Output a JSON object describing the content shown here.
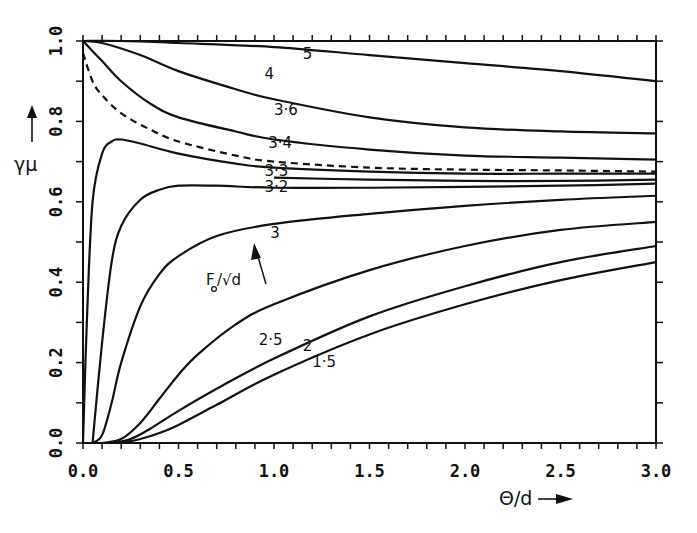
{
  "chart_data": {
    "type": "line",
    "title": "",
    "xlabel": "Θ/d",
    "ylabel": "γμ",
    "xlim": [
      0.0,
      3.0
    ],
    "ylim": [
      0.0,
      1.0
    ],
    "grid": false,
    "legend": null,
    "parameter_label": "F₀/√d",
    "xticks": [
      "0.0",
      "0.5",
      "1.0",
      "1.5",
      "2.0",
      "2.5",
      "3.0"
    ],
    "yticks": [
      "0.0",
      "0.2",
      "0.4",
      "0.6",
      "0.8",
      "1.0"
    ],
    "series": [
      {
        "name": "5",
        "style": "solid",
        "label_at": [
          1.15,
          0.955
        ],
        "x": [
          0.0,
          0.2,
          0.5,
          1.0,
          1.5,
          2.0,
          2.5,
          3.0
        ],
        "y": [
          1.0,
          1.0,
          0.995,
          0.985,
          0.965,
          0.945,
          0.925,
          0.9
        ]
      },
      {
        "name": "4",
        "style": "solid",
        "label_at": [
          0.95,
          0.905
        ],
        "x": [
          0.0,
          0.1,
          0.3,
          0.5,
          0.8,
          1.0,
          1.5,
          2.0,
          2.5,
          3.0
        ],
        "y": [
          1.0,
          0.995,
          0.965,
          0.925,
          0.88,
          0.855,
          0.81,
          0.785,
          0.775,
          0.77
        ]
      },
      {
        "name": "3.6",
        "style": "solid",
        "label_at": [
          1.0,
          0.815
        ],
        "x": [
          0.0,
          0.1,
          0.2,
          0.35,
          0.5,
          0.8,
          1.0,
          1.5,
          2.0,
          2.5,
          3.0
        ],
        "y": [
          1.0,
          0.95,
          0.9,
          0.845,
          0.81,
          0.775,
          0.755,
          0.73,
          0.715,
          0.71,
          0.705
        ]
      },
      {
        "name": "dashed",
        "style": "dashed",
        "label_at": null,
        "x": [
          0.0,
          0.05,
          0.1,
          0.2,
          0.35,
          0.5,
          0.8,
          1.0,
          1.5,
          2.0,
          2.5,
          3.0
        ],
        "y": [
          0.97,
          0.9,
          0.865,
          0.82,
          0.78,
          0.75,
          0.715,
          0.7,
          0.685,
          0.68,
          0.678,
          0.675
        ]
      },
      {
        "name": "3.4",
        "style": "solid",
        "label_at": [
          0.97,
          0.735
        ],
        "x": [
          0.0,
          0.02,
          0.05,
          0.1,
          0.15,
          0.2,
          0.3,
          0.5,
          0.8,
          1.0,
          1.5,
          2.0,
          2.5,
          3.0
        ],
        "y": [
          0.0,
          0.3,
          0.6,
          0.72,
          0.75,
          0.755,
          0.745,
          0.72,
          0.695,
          0.685,
          0.675,
          0.67,
          0.67,
          0.67
        ]
      },
      {
        "name": "3.3",
        "style": "solid",
        "label_at": [
          0.95,
          0.665
        ],
        "x": [
          1.0,
          1.5,
          2.0,
          2.5,
          3.0
        ],
        "y": [
          0.66,
          0.655,
          0.652,
          0.652,
          0.655
        ]
      },
      {
        "name": "3.2",
        "style": "solid",
        "label_at": [
          0.95,
          0.625
        ],
        "x": [
          0.05,
          0.1,
          0.15,
          0.2,
          0.3,
          0.4,
          0.5,
          0.7,
          1.0,
          1.5,
          2.0,
          2.5,
          3.0
        ],
        "y": [
          0.0,
          0.25,
          0.45,
          0.54,
          0.605,
          0.63,
          0.64,
          0.64,
          0.635,
          0.635,
          0.637,
          0.64,
          0.645
        ]
      },
      {
        "name": "3",
        "style": "solid",
        "label_at": [
          0.98,
          0.51
        ],
        "x": [
          0.05,
          0.1,
          0.15,
          0.2,
          0.3,
          0.4,
          0.5,
          0.7,
          1.0,
          1.5,
          2.0,
          2.5,
          3.0
        ],
        "y": [
          0.0,
          0.02,
          0.1,
          0.2,
          0.34,
          0.42,
          0.465,
          0.515,
          0.545,
          0.57,
          0.59,
          0.605,
          0.615
        ]
      },
      {
        "name": "2.5",
        "style": "solid",
        "label_at": [
          0.92,
          0.245
        ],
        "x": [
          0.1,
          0.2,
          0.3,
          0.4,
          0.5,
          0.6,
          0.8,
          1.0,
          1.5,
          2.0,
          2.5,
          3.0
        ],
        "y": [
          0.0,
          0.01,
          0.05,
          0.11,
          0.17,
          0.22,
          0.295,
          0.345,
          0.43,
          0.49,
          0.53,
          0.55
        ]
      },
      {
        "name": "2",
        "style": "solid",
        "label_at": [
          1.15,
          0.23
        ],
        "x": [
          0.15,
          0.25,
          0.35,
          0.5,
          0.7,
          1.0,
          1.5,
          2.0,
          2.5,
          3.0
        ],
        "y": [
          0.0,
          0.01,
          0.035,
          0.08,
          0.135,
          0.21,
          0.315,
          0.39,
          0.45,
          0.49
        ]
      },
      {
        "name": "1.5",
        "style": "solid",
        "label_at": [
          1.2,
          0.19
        ],
        "x": [
          0.2,
          0.3,
          0.4,
          0.5,
          0.7,
          1.0,
          1.5,
          2.0,
          2.5,
          3.0
        ],
        "y": [
          0.0,
          0.01,
          0.025,
          0.045,
          0.095,
          0.17,
          0.27,
          0.345,
          0.405,
          0.45
        ]
      }
    ]
  },
  "axes": {
    "x_title": "Θ/d",
    "y_title": "γμ",
    "param_label_main": "F",
    "param_label_sub": "o",
    "param_label_rest": "/√d"
  }
}
